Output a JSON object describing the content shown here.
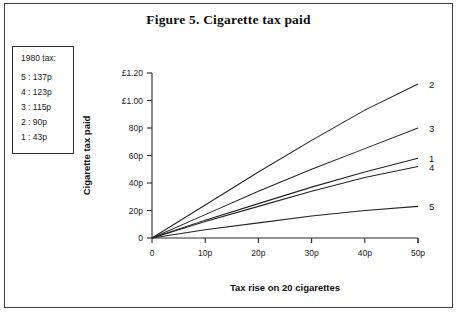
{
  "figure": {
    "title": "Figure 5. Cigarette tax paid",
    "frame_color": "#3a3a3a",
    "background": "#ffffff",
    "line_color": "#232323"
  },
  "legend": {
    "title": "1980 tax:",
    "rows": [
      {
        "key": "5",
        "value": "5 : 137p"
      },
      {
        "key": "4",
        "value": "4 : 123p"
      },
      {
        "key": "3",
        "value": "3 : 115p"
      },
      {
        "key": "2",
        "value": "2 : 90p"
      },
      {
        "key": "1",
        "value": "1 : 43p"
      }
    ]
  },
  "chart_data": {
    "type": "line",
    "title": "Figure 5. Cigarette tax paid",
    "xlabel": "Tax rise on 20 cigarettes",
    "ylabel": "Cigarette tax paid",
    "x": [
      0,
      10,
      20,
      30,
      40,
      50
    ],
    "xlim": [
      0,
      50
    ],
    "ylim": [
      0,
      130
    ],
    "xticklabels": [
      "0",
      "10p",
      "20p",
      "30p",
      "40p",
      "50p"
    ],
    "yticklabels": [
      "0",
      "20p",
      "40p",
      "60p",
      "80p",
      "£1.00",
      "£1.20"
    ],
    "ytickvalues": [
      0,
      20,
      40,
      60,
      80,
      100,
      120
    ],
    "grid": false,
    "legend_position": "right-of-plot-endpoints",
    "series": [
      {
        "name": "1",
        "tax_1980": "43p",
        "values": [
          0,
          13,
          25,
          37,
          48,
          58
        ]
      },
      {
        "name": "2",
        "tax_1980": "90p",
        "values": [
          0,
          24,
          48,
          71,
          93,
          112
        ]
      },
      {
        "name": "3",
        "tax_1980": "115p",
        "values": [
          0,
          17,
          34,
          50,
          65,
          80
        ]
      },
      {
        "name": "4",
        "tax_1980": "123p",
        "values": [
          0,
          12,
          23,
          34,
          44,
          52
        ]
      },
      {
        "name": "5",
        "tax_1980": "137p",
        "values": [
          0,
          6,
          11,
          16,
          20,
          23
        ]
      }
    ],
    "endpoint_labels": [
      {
        "name": "2",
        "y": 112
      },
      {
        "name": "3",
        "y": 80
      },
      {
        "name": "1",
        "y": 58
      },
      {
        "name": "4",
        "y": 52
      },
      {
        "name": "5",
        "y": 23
      }
    ]
  }
}
